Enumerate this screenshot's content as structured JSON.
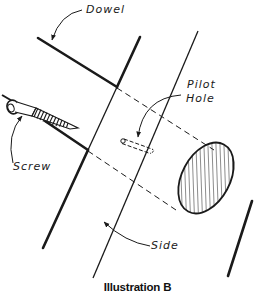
{
  "figure": {
    "caption": "Illustration B",
    "labels": {
      "dowel": "Dowel",
      "pilot_hole_line1": "Pilot",
      "pilot_hole_line2": "Hole",
      "screw": "Screw",
      "side": "Side"
    },
    "colors": {
      "ink": "#1a1a1a",
      "background": "#ffffff"
    }
  }
}
